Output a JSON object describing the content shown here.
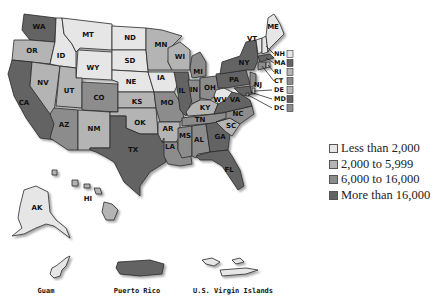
{
  "colors": {
    "bin1": "#e6e6e6",
    "bin2": "#b4b4b4",
    "bin3": "#8c8c8c",
    "bin4": "#636363",
    "border": "#2a2a2a"
  },
  "legend": {
    "items": [
      {
        "label": "Less than 2,000",
        "bin": "bin1"
      },
      {
        "label": "2,000 to 5,999",
        "bin": "bin2"
      },
      {
        "label": "6,000 to 16,000",
        "bin": "bin3"
      },
      {
        "label": "More than 16,000",
        "bin": "bin4"
      }
    ]
  },
  "states": {
    "WA": "bin4",
    "OR": "bin2",
    "CA": "bin4",
    "ID": "bin1",
    "NV": "bin2",
    "MT": "bin1",
    "WY": "bin1",
    "UT": "bin2",
    "AZ": "bin3",
    "CO": "bin3",
    "NM": "bin2",
    "ND": "bin1",
    "SD": "bin1",
    "NE": "bin1",
    "KS": "bin2",
    "OK": "bin2",
    "TX": "bin4",
    "MN": "bin2",
    "IA": "bin1",
    "MO": "bin3",
    "AR": "bin2",
    "LA": "bin3",
    "WI": "bin2",
    "IL": "bin4",
    "MI": "bin3",
    "IN": "bin3",
    "OH": "bin3",
    "KY": "bin2",
    "TN": "bin3",
    "MS": "bin3",
    "AL": "bin3",
    "GA": "bin4",
    "FL": "bin4",
    "SC": "bin2",
    "NC": "bin3",
    "VA": "bin4",
    "WV": "bin1",
    "PA": "bin4",
    "NY": "bin4",
    "VT": "bin1",
    "ME": "bin1",
    "NJ": "bin3",
    "NH": "bin1",
    "MA": "bin4",
    "RI": "bin2",
    "CT": "bin3",
    "DE": "bin2",
    "MD": "bin4",
    "DC": "bin3",
    "AK": "bin1",
    "HI": "bin2"
  },
  "callouts": [
    "NH",
    "MA",
    "RI",
    "CT",
    "DE",
    "MD",
    "DC"
  ],
  "territories": [
    {
      "name": "Guam",
      "bin": "bin1"
    },
    {
      "name": "Puerto Rico",
      "bin": "bin4"
    },
    {
      "name": "U.S. Virgin Islands",
      "bin": "bin1"
    }
  ]
}
